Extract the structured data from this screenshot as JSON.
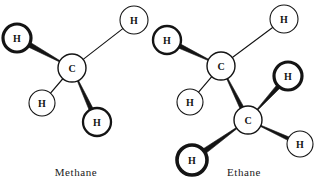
{
  "figure": {
    "kind": "ball-and-stick structural formula illustration",
    "background_color": "#ffffff",
    "ink_color": "#141414",
    "width": 321,
    "height": 189
  },
  "captions": {
    "methane": "Methane",
    "ethane": "Ethane"
  },
  "chart_data": {
    "type": "diagram",
    "title": "",
    "molecules": [
      {
        "name": "Methane",
        "formula": "CH4",
        "caption": "Methane",
        "atoms": [
          {
            "id": "m-c1",
            "element": "C",
            "label": "C",
            "x": 72,
            "y": 68,
            "r": 14,
            "stroke": 1.4,
            "weight": "thin"
          },
          {
            "id": "m-h1",
            "element": "H",
            "label": "H",
            "x": 17,
            "y": 38,
            "r": 14,
            "stroke": 3.2,
            "weight": "bold"
          },
          {
            "id": "m-h2",
            "element": "H",
            "label": "H",
            "x": 134,
            "y": 20,
            "r": 14,
            "stroke": 1.1,
            "weight": "thin"
          },
          {
            "id": "m-h3",
            "element": "H",
            "label": "H",
            "x": 42,
            "y": 103,
            "r": 13,
            "stroke": 1.1,
            "weight": "thin"
          },
          {
            "id": "m-h4",
            "element": "H",
            "label": "H",
            "x": 97,
            "y": 122,
            "r": 14,
            "stroke": 2.3,
            "weight": "medium"
          }
        ],
        "bonds": [
          {
            "from": "m-c1",
            "to": "m-h1",
            "style": "wedge",
            "width": 5.2
          },
          {
            "from": "m-c1",
            "to": "m-h2",
            "style": "line",
            "width": 1.1
          },
          {
            "from": "m-c1",
            "to": "m-h3",
            "style": "line",
            "width": 1.2
          },
          {
            "from": "m-c1",
            "to": "m-h4",
            "style": "wedge",
            "width": 4.4
          }
        ]
      },
      {
        "name": "Ethane",
        "formula": "C2H6",
        "caption": "Ethane",
        "atoms": [
          {
            "id": "e-c1",
            "element": "C",
            "label": "C",
            "x": 221,
            "y": 66,
            "r": 14,
            "stroke": 1.4,
            "weight": "thin"
          },
          {
            "id": "e-c2",
            "element": "C",
            "label": "C",
            "x": 248,
            "y": 120,
            "r": 14,
            "stroke": 1.4,
            "weight": "thin"
          },
          {
            "id": "e-h1",
            "element": "H",
            "label": "H",
            "x": 167,
            "y": 40,
            "r": 14,
            "stroke": 2.4,
            "weight": "medium"
          },
          {
            "id": "e-h2",
            "element": "H",
            "label": "H",
            "x": 284,
            "y": 19,
            "r": 14,
            "stroke": 1.1,
            "weight": "thin"
          },
          {
            "id": "e-h3",
            "element": "H",
            "label": "H",
            "x": 190,
            "y": 102,
            "r": 13,
            "stroke": 1.1,
            "weight": "thin"
          },
          {
            "id": "e-h4",
            "element": "H",
            "label": "H",
            "x": 288,
            "y": 76,
            "r": 14,
            "stroke": 3.2,
            "weight": "bold"
          },
          {
            "id": "e-h5",
            "element": "H",
            "label": "H",
            "x": 192,
            "y": 160,
            "r": 15,
            "stroke": 3.6,
            "weight": "bold"
          },
          {
            "id": "e-h6",
            "element": "H",
            "label": "H",
            "x": 300,
            "y": 144,
            "r": 13,
            "stroke": 1.1,
            "weight": "thin"
          }
        ],
        "bonds": [
          {
            "from": "e-c1",
            "to": "e-h1",
            "style": "wedge",
            "width": 4.6
          },
          {
            "from": "e-c1",
            "to": "e-h2",
            "style": "line",
            "width": 1.1
          },
          {
            "from": "e-c1",
            "to": "e-h3",
            "style": "line",
            "width": 1.2
          },
          {
            "from": "e-c1",
            "to": "e-c2",
            "style": "wedge",
            "width": 4.2
          },
          {
            "from": "e-c2",
            "to": "e-h4",
            "style": "wedge",
            "width": 4.6
          },
          {
            "from": "e-c2",
            "to": "e-h5",
            "style": "wedge",
            "width": 5.4
          },
          {
            "from": "e-c2",
            "to": "e-h6",
            "style": "wedge",
            "width": 3.6
          }
        ]
      }
    ]
  }
}
